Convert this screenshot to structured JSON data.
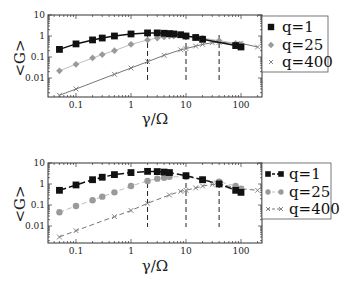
{
  "chart_data": [
    {
      "type": "line",
      "panel": "top",
      "title": "",
      "xlabel": "γ/Ω",
      "ylabel": "<G>",
      "xscale": "log",
      "yscale": "log",
      "xlim": [
        0.03,
        240
      ],
      "ylim": [
        0.0012,
        10
      ],
      "xticks": [
        "0.1",
        "1",
        "10",
        "100"
      ],
      "yticks": [
        "0.01",
        "0.1",
        "1",
        "10"
      ],
      "grid": false,
      "legend_position": "right-outside-top",
      "vlines_dashed": [
        2,
        10,
        40
      ],
      "line_style": "solid",
      "series": [
        {
          "name": "q=1",
          "marker": "square",
          "color": "#111111",
          "x": [
            0.05,
            0.1,
            0.2,
            0.3,
            0.5,
            1,
            2,
            3,
            4,
            5,
            6,
            8,
            10,
            15,
            20,
            80,
            100
          ],
          "y": [
            0.23,
            0.42,
            0.65,
            0.8,
            1.0,
            1.25,
            1.4,
            1.4,
            1.35,
            1.3,
            1.25,
            1.15,
            1.0,
            0.85,
            0.7,
            0.35,
            0.3
          ]
        },
        {
          "name": "q=25",
          "marker": "diamond",
          "color": "#9a9a9a",
          "x": [
            0.05,
            0.1,
            0.2,
            0.3,
            0.5,
            1,
            2,
            3,
            4,
            5,
            6,
            10,
            20,
            40,
            80,
            100
          ],
          "y": [
            0.022,
            0.045,
            0.09,
            0.13,
            0.2,
            0.4,
            0.65,
            0.8,
            0.9,
            1.0,
            1.0,
            1.0,
            0.8,
            0.6,
            0.45,
            0.4
          ]
        },
        {
          "name": "q=400",
          "marker": "x",
          "color": "#777777",
          "x": [
            0.05,
            0.1,
            0.5,
            1,
            2,
            4,
            8,
            10,
            15,
            20,
            30,
            40,
            100,
            200
          ],
          "y": [
            0.0015,
            0.003,
            0.015,
            0.03,
            0.06,
            0.12,
            0.22,
            0.25,
            0.33,
            0.4,
            0.48,
            0.5,
            0.45,
            0.3
          ]
        }
      ]
    },
    {
      "type": "line",
      "panel": "bottom",
      "title": "",
      "xlabel": "γ/Ω",
      "ylabel": "<G>",
      "xscale": "log",
      "yscale": "log",
      "xlim": [
        0.03,
        240
      ],
      "ylim": [
        0.0012,
        10
      ],
      "xticks": [
        "0.1",
        "1",
        "10",
        "100"
      ],
      "yticks": [
        "0.01",
        "0.1",
        "1",
        "10"
      ],
      "grid": false,
      "legend_position": "right-outside-top",
      "vlines_dashed": [
        2,
        10,
        40
      ],
      "line_style": "dashed",
      "series": [
        {
          "name": "q=1",
          "marker": "square",
          "color": "#111111",
          "x": [
            0.05,
            0.1,
            0.2,
            0.3,
            0.5,
            1,
            2,
            3,
            4,
            5,
            10,
            20,
            40,
            80,
            100
          ],
          "y": [
            0.5,
            0.9,
            1.6,
            2.1,
            2.8,
            3.5,
            4.0,
            3.9,
            3.7,
            3.5,
            2.5,
            1.6,
            1.0,
            0.5,
            0.4
          ]
        },
        {
          "name": "q=25",
          "marker": "circle",
          "color": "#9a9a9a",
          "x": [
            0.05,
            0.1,
            0.2,
            0.3,
            0.5,
            1,
            2,
            3,
            4,
            5,
            10,
            20,
            40,
            80,
            100
          ],
          "y": [
            0.045,
            0.09,
            0.17,
            0.25,
            0.4,
            0.8,
            1.4,
            1.8,
            2.0,
            2.2,
            2.2,
            1.6,
            1.3,
            0.8,
            0.6
          ]
        },
        {
          "name": "q=400",
          "marker": "x",
          "color": "#777777",
          "x": [
            0.05,
            0.1,
            0.5,
            1,
            2,
            5,
            8,
            10,
            15,
            20,
            30,
            40,
            100,
            200
          ],
          "y": [
            0.003,
            0.006,
            0.028,
            0.055,
            0.12,
            0.3,
            0.45,
            0.5,
            0.65,
            0.8,
            0.95,
            1.0,
            0.6,
            0.5
          ]
        }
      ]
    }
  ],
  "panels": [
    {
      "xlabel": "γ/Ω",
      "ylabel": "<G>",
      "xticks": [
        "0.1",
        "1",
        "10",
        "100"
      ],
      "yticks": [
        "0.01",
        "0.1",
        "1",
        "10"
      ],
      "legend": [
        "q=1",
        "q=25",
        "q=400"
      ]
    },
    {
      "xlabel": "γ/Ω",
      "ylabel": "<G>",
      "xticks": [
        "0.1",
        "1",
        "10",
        "100"
      ],
      "yticks": [
        "0.01",
        "0.1",
        "1",
        "10"
      ],
      "legend": [
        "q=1",
        "q=25",
        "q=400"
      ]
    }
  ]
}
